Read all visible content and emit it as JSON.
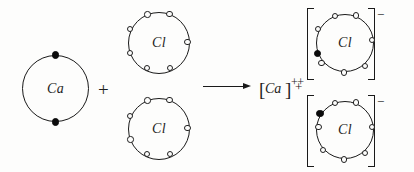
{
  "diagram": {
    "equation_text": "Ca + Cl + Cl  →  [Ca]++ + [Cl]- + [Cl]-",
    "background_color": "#fdfdfc",
    "ink_color": "#1a1a1a",
    "electron_filled_color": "#0b0b0b",
    "electron_open_fill": "#fdfdfc"
  },
  "reactants": {
    "calcium": {
      "symbol": "Ca",
      "shell_electrons_filled": 2,
      "shell_electrons_open": 0,
      "electron_positions_deg": [
        90,
        270
      ]
    },
    "operator_plus": "+",
    "chlorine_top": {
      "symbol": "Cl",
      "shell_electrons_open": 7,
      "shell_electrons_filled": 0,
      "electron_positions_deg": [
        68,
        112,
        158,
        202,
        248,
        292,
        338
      ]
    },
    "chlorine_bottom": {
      "symbol": "Cl",
      "shell_electrons_open": 7,
      "shell_electrons_filled": 0,
      "electron_positions_deg": [
        68,
        112,
        158,
        202,
        248,
        292,
        338
      ]
    }
  },
  "reaction_arrow": {
    "icon": "right-arrow-icon",
    "direction": "right"
  },
  "products": {
    "calcium_ion": {
      "bracket_open": "[",
      "symbol": "Ca",
      "bracket_close": "]",
      "charge": "++"
    },
    "operator_plus": "+",
    "chloride_ion_top": {
      "symbol": "Cl",
      "charge": "−",
      "shell_electrons_open": 7,
      "shell_electrons_filled": 1,
      "filled_electron_position_deg": 195,
      "open_positions_deg": [
        68,
        112,
        158,
        240,
        292,
        338,
        22
      ]
    },
    "chloride_ion_bottom": {
      "symbol": "Cl",
      "charge": "−",
      "shell_electrons_open": 7,
      "shell_electrons_filled": 1,
      "filled_electron_position_deg": 155,
      "open_positions_deg": [
        68,
        112,
        200,
        248,
        292,
        338,
        22
      ]
    }
  }
}
